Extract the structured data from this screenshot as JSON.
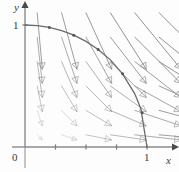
{
  "figure": {
    "kind": "direction-field-with-curve",
    "background": "#fdfdfd"
  },
  "axes": {
    "x_label": "x",
    "y_label": "y",
    "origin_label": "0",
    "x_tick_label": "1",
    "y_tick_label": "1",
    "axis_color": "#8a8a8a",
    "origin_px": [
      25,
      147
    ],
    "unit_px": 122,
    "x_ticks": [
      0.25,
      0.5,
      0.75,
      1.0
    ],
    "y_ticks": [
      1.0
    ]
  },
  "curve": {
    "name": "unit-quarter-circle",
    "equation": "x^2 + y^2 = 1",
    "color": "#6b6b6b",
    "from": [
      0,
      1
    ],
    "to": [
      1,
      0
    ],
    "marker_points": [
      [
        0.2,
        0.9798
      ],
      [
        0.4,
        0.9165
      ],
      [
        0.6,
        0.8
      ],
      [
        0.8,
        0.6
      ],
      [
        0.96,
        0.28
      ]
    ]
  },
  "chart_data": {
    "type": "scatter",
    "title": "",
    "xlabel": "x",
    "ylabel": "y",
    "xlim": [
      0,
      1.18
    ],
    "ylim": [
      0,
      1.18
    ],
    "grid": false,
    "legend": null,
    "annotations": [
      "0",
      "1",
      "1",
      "x",
      "y"
    ],
    "curves": [
      {
        "name": "unit circle (first quadrant)",
        "equation": "x^2 + y^2 = 1",
        "x": [
          0.0,
          0.1,
          0.2,
          0.3,
          0.4,
          0.5,
          0.6,
          0.7,
          0.8,
          0.9,
          0.95,
          1.0
        ],
        "y": [
          1.0,
          0.995,
          0.9798,
          0.9539,
          0.9165,
          0.866,
          0.8,
          0.7141,
          0.6,
          0.4359,
          0.3122,
          0.0
        ]
      }
    ],
    "vector_field": {
      "description": "slope/direction field, arrows point down and to the right; length grows with distance from the origin",
      "grid_x": [
        0.1,
        0.3,
        0.5,
        0.7,
        0.9,
        1.1
      ],
      "grid_y": [
        0.1,
        0.3,
        0.5,
        0.7,
        0.9,
        1.1
      ],
      "u_formula": "x",
      "v_formula": "-y",
      "arrow_color": "#8c8c8c",
      "scale": 0.42
    }
  }
}
